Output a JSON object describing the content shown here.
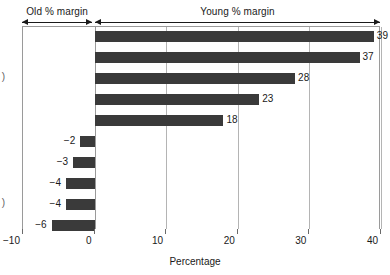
{
  "chart_data": {
    "type": "bar",
    "orientation": "horizontal",
    "title": "",
    "xlabel": "Percentage",
    "ylabel": "",
    "xlim": [
      -10,
      40
    ],
    "xticks": [
      -10,
      0,
      10,
      20,
      30,
      40
    ],
    "xticklabels": [
      "−10",
      "0",
      "10",
      "20",
      "30",
      "40"
    ],
    "grid": true,
    "grid_axis": "x",
    "legend": "none",
    "bar_color": "#3a3a3a",
    "categories": [
      "",
      "",
      "",
      "",
      "",
      "",
      "",
      "",
      "",
      ""
    ],
    "values": [
      39,
      37,
      28,
      23,
      18,
      -2,
      -3,
      -4,
      -4,
      -6
    ],
    "datalabels": [
      "39",
      "37",
      "28",
      "23",
      "18",
      "−2",
      "−3",
      "−4",
      "−4",
      "−6"
    ],
    "annotations": [
      {
        "text": "Old % margin",
        "from": -10,
        "to": -0.2
      },
      {
        "text": "Young % margin",
        "from": 0.2,
        "to": 40
      }
    ],
    "clipped_row_labels": [
      ")",
      ")"
    ]
  },
  "axis": {
    "x_title": "Percentage",
    "ticks": [
      {
        "label": "−10",
        "value": -10
      },
      {
        "label": "0",
        "value": 0
      },
      {
        "label": "10",
        "value": 10
      },
      {
        "label": "20",
        "value": 20
      },
      {
        "label": "30",
        "value": 30
      },
      {
        "label": "40",
        "value": 40
      }
    ]
  },
  "header": {
    "old_range_label": "Old % margin",
    "young_range_label": "Young % margin"
  },
  "bars": [
    {
      "value": 39,
      "label": "39",
      "sign": "positive"
    },
    {
      "value": 37,
      "label": "37",
      "sign": "positive"
    },
    {
      "value": 28,
      "label": "28",
      "sign": "positive"
    },
    {
      "value": 23,
      "label": "23",
      "sign": "positive"
    },
    {
      "value": 18,
      "label": "18",
      "sign": "positive"
    },
    {
      "value": -2,
      "label": "−2",
      "sign": "negative"
    },
    {
      "value": -3,
      "label": "−3",
      "sign": "negative"
    },
    {
      "value": -4,
      "label": "−4",
      "sign": "negative"
    },
    {
      "value": -4,
      "label": "−4",
      "sign": "negative"
    },
    {
      "value": -6,
      "label": "−6",
      "sign": "negative"
    }
  ],
  "clipped_labels": [
    {
      "text": ")",
      "row": 2
    },
    {
      "text": ")",
      "row": 8
    }
  ]
}
